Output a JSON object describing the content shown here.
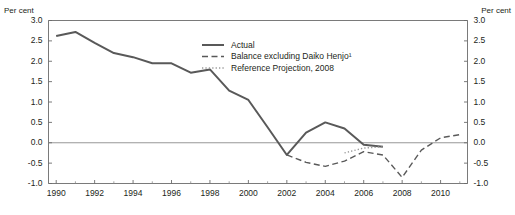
{
  "axis_titles": {
    "left": "Per cent",
    "right": "Per cent"
  },
  "legend": {
    "items": [
      {
        "label": "Actual",
        "style": "solid"
      },
      {
        "label": "Balance excluding Daiko Henjo¹",
        "style": "dashed"
      },
      {
        "label": "Reference Projection, 2008",
        "style": "dotted"
      }
    ]
  },
  "chart_data": {
    "type": "line",
    "title": "",
    "subtitle": "",
    "xlabel": "",
    "ylabel": "Per cent",
    "xlim": [
      1989.6,
      2011.4
    ],
    "ylim": [
      -1.0,
      3.0
    ],
    "grid": false,
    "zero_line": true,
    "legend_position": "inside-top-center",
    "x_tick_labels": [
      "1990",
      "1992",
      "1994",
      "1996",
      "1998",
      "2000",
      "2002",
      "2004",
      "2006",
      "2008",
      "2010"
    ],
    "x_tick_values": [
      1990,
      1992,
      1994,
      1996,
      1998,
      2000,
      2002,
      2004,
      2006,
      2008,
      2010
    ],
    "x_minor_ticks": [
      1991,
      1993,
      1995,
      1997,
      1999,
      2001,
      2003,
      2005,
      2007,
      2009,
      2011
    ],
    "y_tick_labels": [
      "3.0",
      "2.5",
      "2.0",
      "1.5",
      "1.0",
      "0.5",
      "0.0",
      "-0.5",
      "-1.0"
    ],
    "y_tick_values": [
      3.0,
      2.5,
      2.0,
      1.5,
      1.0,
      0.5,
      0.0,
      -0.5,
      -1.0
    ],
    "series": [
      {
        "name": "Actual",
        "style": "solid",
        "color": "#595959",
        "x": [
          1990,
          1991,
          1992,
          1993,
          1994,
          1995,
          1996,
          1997,
          1998,
          1999,
          2000,
          2001,
          2002,
          2003,
          2004,
          2005,
          2006,
          2007
        ],
        "values": [
          2.62,
          2.72,
          2.45,
          2.2,
          2.1,
          1.95,
          1.95,
          1.72,
          1.8,
          1.28,
          1.05,
          0.38,
          -0.3,
          0.25,
          0.5,
          0.35,
          -0.05,
          -0.1
        ]
      },
      {
        "name": "Balance excluding Daiko Henjo¹",
        "style": "dashed",
        "color": "#595959",
        "x": [
          2002,
          2003,
          2004,
          2005,
          2006,
          2007,
          2008,
          2009,
          2010,
          2011
        ],
        "values": [
          -0.3,
          -0.48,
          -0.58,
          -0.45,
          -0.22,
          -0.3,
          -0.85,
          -0.18,
          0.12,
          0.2
        ]
      },
      {
        "name": "Reference Projection, 2008",
        "style": "dotted",
        "color": "#9a9a9a",
        "x": [
          2005,
          2006,
          2007
        ],
        "values": [
          -0.25,
          -0.13,
          -0.1
        ]
      }
    ]
  }
}
